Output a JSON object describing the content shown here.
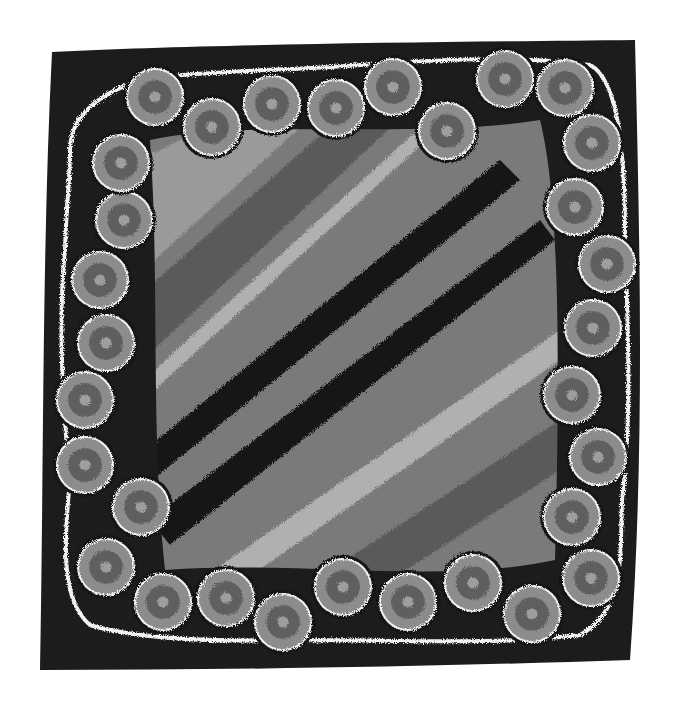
{
  "image": {
    "subject": "grayscale photograph of a square printed textile scarf",
    "background": "#ffffff",
    "colors": {
      "border_black": "#1c1c1c",
      "field_dark": "#5a5a5a",
      "field_mid": "#7a7a7a",
      "field_light": "#9a9a9a",
      "stripe_black": "#141414",
      "stripe_light": "#b0b0b0",
      "outline_white": "#f2f2f2",
      "dot_outer": "#8c8c8c",
      "dot_inner": "#5e5e5e",
      "dot_center": "#9e9e9e"
    },
    "border_dots": [
      [
        155,
        97,
        28
      ],
      [
        212,
        127,
        28
      ],
      [
        272,
        104,
        28
      ],
      [
        336,
        108,
        28
      ],
      [
        393,
        87,
        28
      ],
      [
        447,
        131,
        28
      ],
      [
        505,
        79,
        28
      ],
      [
        565,
        88,
        28
      ],
      [
        592,
        143,
        28
      ],
      [
        575,
        207,
        28
      ],
      [
        607,
        264,
        28
      ],
      [
        593,
        328,
        28
      ],
      [
        572,
        395,
        28
      ],
      [
        598,
        457,
        28
      ],
      [
        572,
        517,
        28
      ],
      [
        591,
        578,
        28
      ],
      [
        532,
        614,
        28
      ],
      [
        473,
        583,
        28
      ],
      [
        408,
        602,
        28
      ],
      [
        343,
        587,
        28
      ],
      [
        283,
        622,
        28
      ],
      [
        226,
        598,
        28
      ],
      [
        163,
        602,
        28
      ],
      [
        106,
        567,
        28
      ],
      [
        141,
        507,
        28
      ],
      [
        85,
        465,
        28
      ],
      [
        85,
        400,
        28
      ],
      [
        106,
        343,
        28
      ],
      [
        100,
        280,
        28
      ],
      [
        124,
        220,
        28
      ],
      [
        121,
        163,
        28
      ]
    ]
  }
}
